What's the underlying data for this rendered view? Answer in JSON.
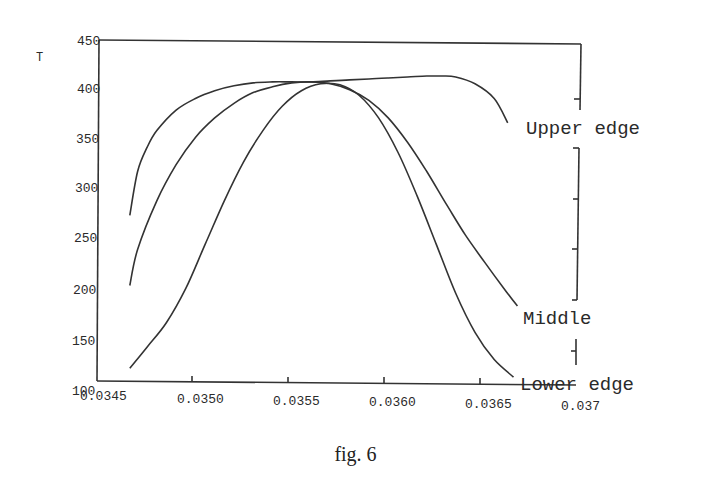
{
  "figure": {
    "caption": "fig. 6"
  },
  "chart_data": {
    "type": "line",
    "title": "",
    "xlabel": "",
    "ylabel": "T",
    "xlim": [
      0.0345,
      0.037
    ],
    "ylim": [
      100,
      450
    ],
    "grid": false,
    "legend_position": "right, inline labels",
    "x_ticks": [
      "0.0345",
      "0.0350",
      "0.0355",
      "0.0360",
      "0.0365",
      "0.037"
    ],
    "x_tick_values": [
      0.0345,
      0.035,
      0.0355,
      0.036,
      0.0365,
      0.037
    ],
    "y_ticks": [
      "100",
      "150",
      "200",
      "250",
      "300",
      "350",
      "400",
      "450"
    ],
    "y_tick_values": [
      100,
      150,
      200,
      250,
      300,
      350,
      400,
      450
    ],
    "series": [
      {
        "name": "Upper edge",
        "x": [
          0.03466,
          0.0347,
          0.03475,
          0.0348,
          0.0349,
          0.035,
          0.0351,
          0.0352,
          0.0353,
          0.0354,
          0.0355,
          0.0356,
          0.0357,
          0.0358,
          0.0359,
          0.036,
          0.0361,
          0.0362,
          0.03628,
          0.03635,
          0.03645,
          0.03655,
          0.03662
        ],
        "values": [
          270,
          315,
          340,
          357,
          378,
          390,
          398,
          403,
          406,
          407,
          407,
          407,
          408,
          409,
          410,
          411,
          412,
          413,
          413,
          412,
          405,
          390,
          365
        ]
      },
      {
        "name": "Middle",
        "x": [
          0.03466,
          0.0347,
          0.0348,
          0.0349,
          0.035,
          0.0351,
          0.0352,
          0.0353,
          0.0354,
          0.0355,
          0.0356,
          0.0357,
          0.0358,
          0.0359,
          0.036,
          0.0361,
          0.0362,
          0.0363,
          0.0364,
          0.0365,
          0.0366,
          0.03667
        ],
        "values": [
          198,
          235,
          285,
          322,
          350,
          370,
          385,
          396,
          402,
          406,
          407,
          405,
          399,
          388,
          370,
          345,
          315,
          282,
          250,
          222,
          195,
          177
        ]
      },
      {
        "name": "Lower edge",
        "x": [
          0.03466,
          0.03475,
          0.03485,
          0.03495,
          0.03505,
          0.03515,
          0.03525,
          0.03535,
          0.03545,
          0.03555,
          0.03565,
          0.03575,
          0.03585,
          0.03595,
          0.03605,
          0.03615,
          0.03625,
          0.03635,
          0.03645,
          0.03655,
          0.03665
        ],
        "values": [
          113,
          135,
          160,
          195,
          240,
          285,
          325,
          357,
          382,
          398,
          405,
          404,
          393,
          370,
          335,
          290,
          240,
          190,
          150,
          122,
          104
        ]
      }
    ]
  }
}
